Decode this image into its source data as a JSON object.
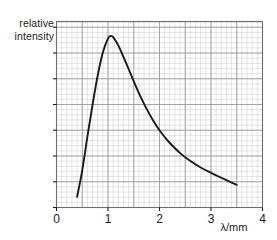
{
  "chart_data": {
    "type": "line",
    "title": "",
    "subtitle": "",
    "xlabel": "λ/mm",
    "ylabel_lines": [
      "relative",
      "intensity"
    ],
    "ylabel": "relative intensity",
    "xlim": [
      0,
      4
    ],
    "ylim": [
      0,
      1.05
    ],
    "xticks": [
      0,
      1,
      2,
      3,
      4
    ],
    "xticklabels": [
      "0",
      "1",
      "2",
      "3",
      "4"
    ],
    "yticks": [],
    "yticklabels": [],
    "grid": true,
    "grid_minor_step_x": 0.1,
    "grid_major_step_x": 0.5,
    "legend": null,
    "annotations": [],
    "series": [
      {
        "name": "spectral radiance",
        "color": "#1a1a1a",
        "x": [
          0.4,
          0.5,
          0.6,
          0.7,
          0.8,
          0.9,
          1.0,
          1.05,
          1.1,
          1.2,
          1.3,
          1.4,
          1.5,
          1.6,
          1.7,
          1.8,
          1.9,
          2.0,
          2.1,
          2.2,
          2.4,
          2.6,
          2.8,
          3.0,
          3.2,
          3.4,
          3.5
        ],
        "y": [
          0.06,
          0.21,
          0.4,
          0.58,
          0.745,
          0.875,
          0.955,
          0.968,
          0.962,
          0.915,
          0.85,
          0.782,
          0.712,
          0.646,
          0.585,
          0.53,
          0.48,
          0.436,
          0.398,
          0.364,
          0.307,
          0.262,
          0.226,
          0.196,
          0.168,
          0.141,
          0.128
        ]
      }
    ]
  },
  "axes": {
    "x_axis_title": "λ/mm",
    "y_axis_title_line1": "relative",
    "y_axis_title_line2": "intensity"
  },
  "colors": {
    "curve": "#1a1a1a",
    "grid_minor": "#d8d8d8",
    "grid_major": "#9a9a9a",
    "frame": "#6e6e6e",
    "text": "#1a1a1a",
    "background": "#ffffff"
  }
}
